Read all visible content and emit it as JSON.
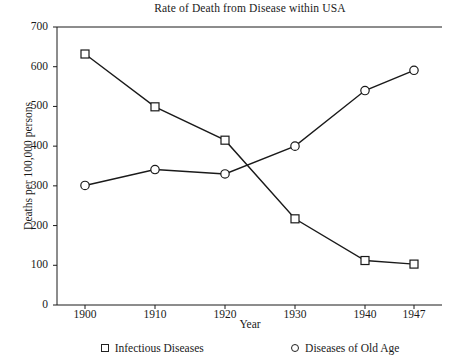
{
  "chart_data": {
    "type": "line",
    "title": "Rate of Death from Disease within USA",
    "xlabel": "Year",
    "ylabel": "Deaths per 100,000 persons",
    "x": [
      1900,
      1910,
      1920,
      1930,
      1940,
      1947
    ],
    "xtick_labels": [
      "1900",
      "1910",
      "1920",
      "1930",
      "1940",
      "1947"
    ],
    "ytick_labels": [
      "0",
      "100",
      "200",
      "300",
      "400",
      "500",
      "600",
      "700"
    ],
    "yticks": [
      0,
      100,
      200,
      300,
      400,
      500,
      600,
      700
    ],
    "ylim": [
      0,
      700
    ],
    "xlim": [
      1896,
      1951
    ],
    "grid": false,
    "legend_position": "below",
    "series": [
      {
        "name": "Infectious Diseases",
        "marker": "square",
        "color": "#1a1a1a",
        "values": [
          632,
          499,
          415,
          217,
          112,
          103
        ]
      },
      {
        "name": "Diseases of Old Age",
        "marker": "circle",
        "color": "#1a1a1a",
        "values": [
          301,
          341,
          330,
          400,
          540,
          591
        ]
      }
    ]
  },
  "legend": {
    "items": [
      {
        "label": "Infectious Diseases",
        "symbol": "square-marker"
      },
      {
        "label": "Diseases of Old Age",
        "symbol": "circle-marker"
      }
    ]
  },
  "colors": {
    "axis": "#1a1a1a",
    "series_infectious": "#1a1a1a",
    "series_old_age": "#1a1a1a",
    "background": "#ffffff"
  }
}
